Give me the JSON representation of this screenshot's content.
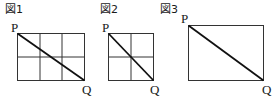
{
  "figures": [
    {
      "label": "図1",
      "grid": {
        "cols": 3,
        "rows": 2
      },
      "start_point": "P",
      "end_point": "Q"
    },
    {
      "label": "図2",
      "grid": {
        "cols": 2,
        "rows": 2
      },
      "start_point": "P",
      "end_point": "Q"
    },
    {
      "label": "図3",
      "grid": {
        "cols": 1,
        "rows": 1
      },
      "start_point": "P",
      "end_point": "Q"
    }
  ],
  "colors": {
    "line": "#1a1a1a",
    "grid": "#333333"
  }
}
